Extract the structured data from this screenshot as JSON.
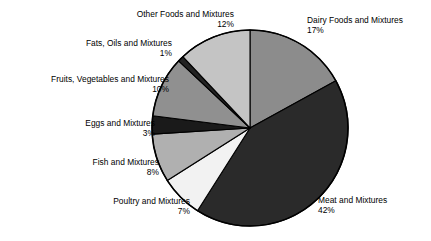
{
  "chart_data": {
    "type": "pie",
    "title": "",
    "subtitle": "",
    "xlabel": "",
    "ylabel": "",
    "legend_position": "none",
    "grid": false,
    "value_unit": "percent",
    "start_angle_deg": 0,
    "direction": "clockwise",
    "categories": [
      "Dairy Foods and Mixtures",
      "Meat and Mixtures",
      "Poultry and Mixtures",
      "Fish and Mixtures",
      "Eggs and Mixtures",
      "Fruits, Vegetables and Mixtures",
      "Fats, Oils and Mixtures",
      "Other Foods and Mixtures"
    ],
    "values": [
      17,
      42,
      7,
      8,
      3,
      10,
      1,
      12
    ],
    "value_labels": [
      "17%",
      "42%",
      "7%",
      "8%",
      "3%",
      "10%",
      "1%",
      "12%"
    ],
    "colors": [
      "#8c8c8c",
      "#2a2a2a",
      "#f2f2f2",
      "#b0b0b0",
      "#1a1a1a",
      "#909090",
      "#232323",
      "#c4c4c4"
    ],
    "slices": [
      {
        "label": "Dairy Foods and Mixtures",
        "value": 17,
        "value_label": "17%",
        "color": "#8c8c8c"
      },
      {
        "label": "Meat and Mixtures",
        "value": 42,
        "value_label": "42%",
        "color": "#2a2a2a"
      },
      {
        "label": "Poultry and Mixtures",
        "value": 7,
        "value_label": "7%",
        "color": "#f2f2f2"
      },
      {
        "label": "Fish and Mixtures",
        "value": 8,
        "value_label": "8%",
        "color": "#b0b0b0"
      },
      {
        "label": "Eggs and Mixtures",
        "value": 3,
        "value_label": "3%",
        "color": "#1a1a1a"
      },
      {
        "label": "Fruits, Vegetables and Mixtures",
        "value": 10,
        "value_label": "10%",
        "color": "#909090"
      },
      {
        "label": "Fats, Oils and Mixtures",
        "value": 1,
        "value_label": "1%",
        "color": "#232323"
      },
      {
        "label": "Other Foods and Mixtures",
        "value": 12,
        "value_label": "12%",
        "color": "#c4c4c4"
      }
    ]
  },
  "labels": {
    "other": {
      "name": "Other Foods and Mixtures",
      "pct": "12%"
    },
    "fats": {
      "name": "Fats, Oils and Mixtures",
      "pct": "1%"
    },
    "fruits": {
      "name": "Fruits, Vegetables and Mixtures",
      "pct": "10%"
    },
    "eggs": {
      "name": "Eggs and Mixtures",
      "pct": "3%"
    },
    "fish": {
      "name": "Fish and Mixtures",
      "pct": "8%"
    },
    "poultry": {
      "name": "Poultry and Mixtures",
      "pct": "7%"
    },
    "dairy": {
      "name": "Dairy Foods and Mixtures",
      "pct": "17%"
    },
    "meat": {
      "name": "Meat and Mixtures",
      "pct": "42%"
    }
  },
  "style": {
    "background": "#ffffff",
    "outline": "#000000",
    "text": "#000000"
  }
}
